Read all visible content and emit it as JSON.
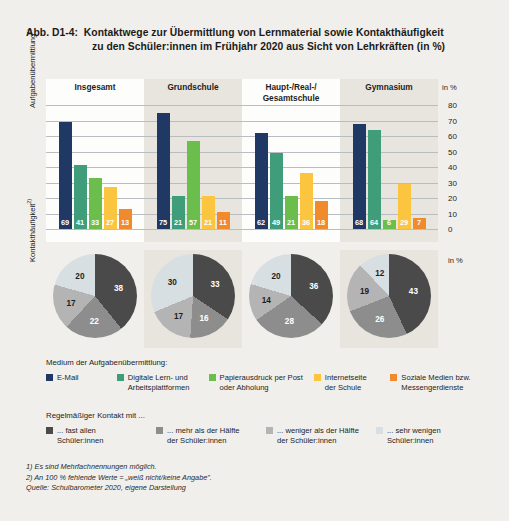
{
  "figure": {
    "number": "Abb. D1-4:",
    "title_line1": "Kontaktwege zur Übermittlung von Lernmaterial sowie Kontakthäufigkeit",
    "title_line2": "zu den Schüler:innen im Frühjahr 2020 aus Sicht von Lehrkräften (in %)"
  },
  "axes": {
    "bars_y_label": "Aufgabenübermittlung",
    "bars_y_label_sup": "1)",
    "pies_y_label": "Kontakthäufigkeit",
    "pies_y_label_sup": "2)",
    "unit_bars": "in %",
    "unit_pies": "in %",
    "ticks": [
      "80",
      "70",
      "60",
      "50",
      "40",
      "30",
      "20",
      "10",
      "0"
    ]
  },
  "groups": [
    "Insgesamt",
    "Grundschule",
    "Haupt-/Real-/\nGesamtschule",
    "Gymnasium"
  ],
  "group_labels": {
    "g0": "Insgesamt",
    "g1": "Grundschule",
    "g2a": "Haupt-/Real-/",
    "g2b": "Gesamtschule",
    "g3": "Gymnasium"
  },
  "bar_legend": {
    "title": "Medium der Aufgabenübermittlung:",
    "items": [
      {
        "label": "E-Mail",
        "color": "#1f3864"
      },
      {
        "label": "Digitale Lern- und\nArbeitsplattformen",
        "color": "#3f9e79"
      },
      {
        "label": "Papierausdruck per Post\noder Abholung",
        "color": "#6bbe4b"
      },
      {
        "label": "Internetseite\nder Schule",
        "color": "#fbc540"
      },
      {
        "label": "Soziale Medien  bzw.\nMessengerdienste",
        "color": "#f08a2c"
      }
    ]
  },
  "pie_legend": {
    "title": "Regelmäßiger Kontakt mit ...",
    "items": [
      {
        "label": "... fast allen\nSchüler:innen",
        "color": "#4a4a4a"
      },
      {
        "label": "... mehr als der Hälfte\nder Schüler:innen",
        "color": "#8d8d8d"
      },
      {
        "label": "... weniger als der Hälfte\nder Schüler:innen",
        "color": "#b4b4b4"
      },
      {
        "label": "... sehr wenigen\nSchüler:innen",
        "color": "#d8dfe2"
      }
    ]
  },
  "notes": {
    "n1": "1) Es sind Mehrfachnennungen möglich.",
    "n2": "2) An 100 % fehlende Werte = „weiß nicht/keine Angabe\".",
    "source": "Quelle: Schulbarometer 2020, eigene Darstellung"
  },
  "chart_data": [
    {
      "type": "bar",
      "title": "Kontaktwege zur Übermittlung von Lernmaterial (in %)",
      "xlabel": "",
      "ylabel": "Aufgabenübermittlung",
      "ylim": [
        0,
        80
      ],
      "grid": true,
      "categories": [
        "Insgesamt",
        "Grundschule",
        "Haupt-/Real-/Gesamtschule",
        "Gymnasium"
      ],
      "series": [
        {
          "name": "E-Mail",
          "color": "#1f3864",
          "values": [
            69,
            75,
            62,
            68
          ]
        },
        {
          "name": "Digitale Lern- und Arbeitsplattformen",
          "color": "#3f9e79",
          "values": [
            41,
            21,
            49,
            64
          ]
        },
        {
          "name": "Papierausdruck per Post oder Abholung",
          "color": "#6bbe4b",
          "values": [
            33,
            57,
            21,
            6
          ]
        },
        {
          "name": "Internetseite der Schule",
          "color": "#fbc540",
          "values": [
            27,
            21,
            36,
            29
          ]
        },
        {
          "name": "Soziale Medien bzw. Messengerdienste",
          "color": "#f08a2c",
          "values": [
            13,
            11,
            18,
            7
          ]
        }
      ]
    },
    {
      "type": "pie",
      "title": "Kontakthäufigkeit zu den Schüler:innen (in %)",
      "legend_position": "bottom",
      "slice_labels": [
        "... fast allen Schüler:innen",
        "... mehr als der Hälfte der Schüler:innen",
        "... weniger als der Hälfte der Schüler:innen",
        "... sehr wenigen Schüler:innen"
      ],
      "colors": [
        "#4a4a4a",
        "#8d8d8d",
        "#b4b4b4",
        "#d8dfe2"
      ],
      "pies": [
        {
          "name": "Insgesamt",
          "values": [
            38,
            22,
            17,
            20
          ]
        },
        {
          "name": "Grundschule",
          "values": [
            33,
            16,
            17,
            30
          ]
        },
        {
          "name": "Haupt-/Real-/Gesamtschule",
          "values": [
            36,
            28,
            14,
            20
          ]
        },
        {
          "name": "Gymnasium",
          "values": [
            43,
            26,
            19,
            12
          ]
        }
      ]
    }
  ]
}
